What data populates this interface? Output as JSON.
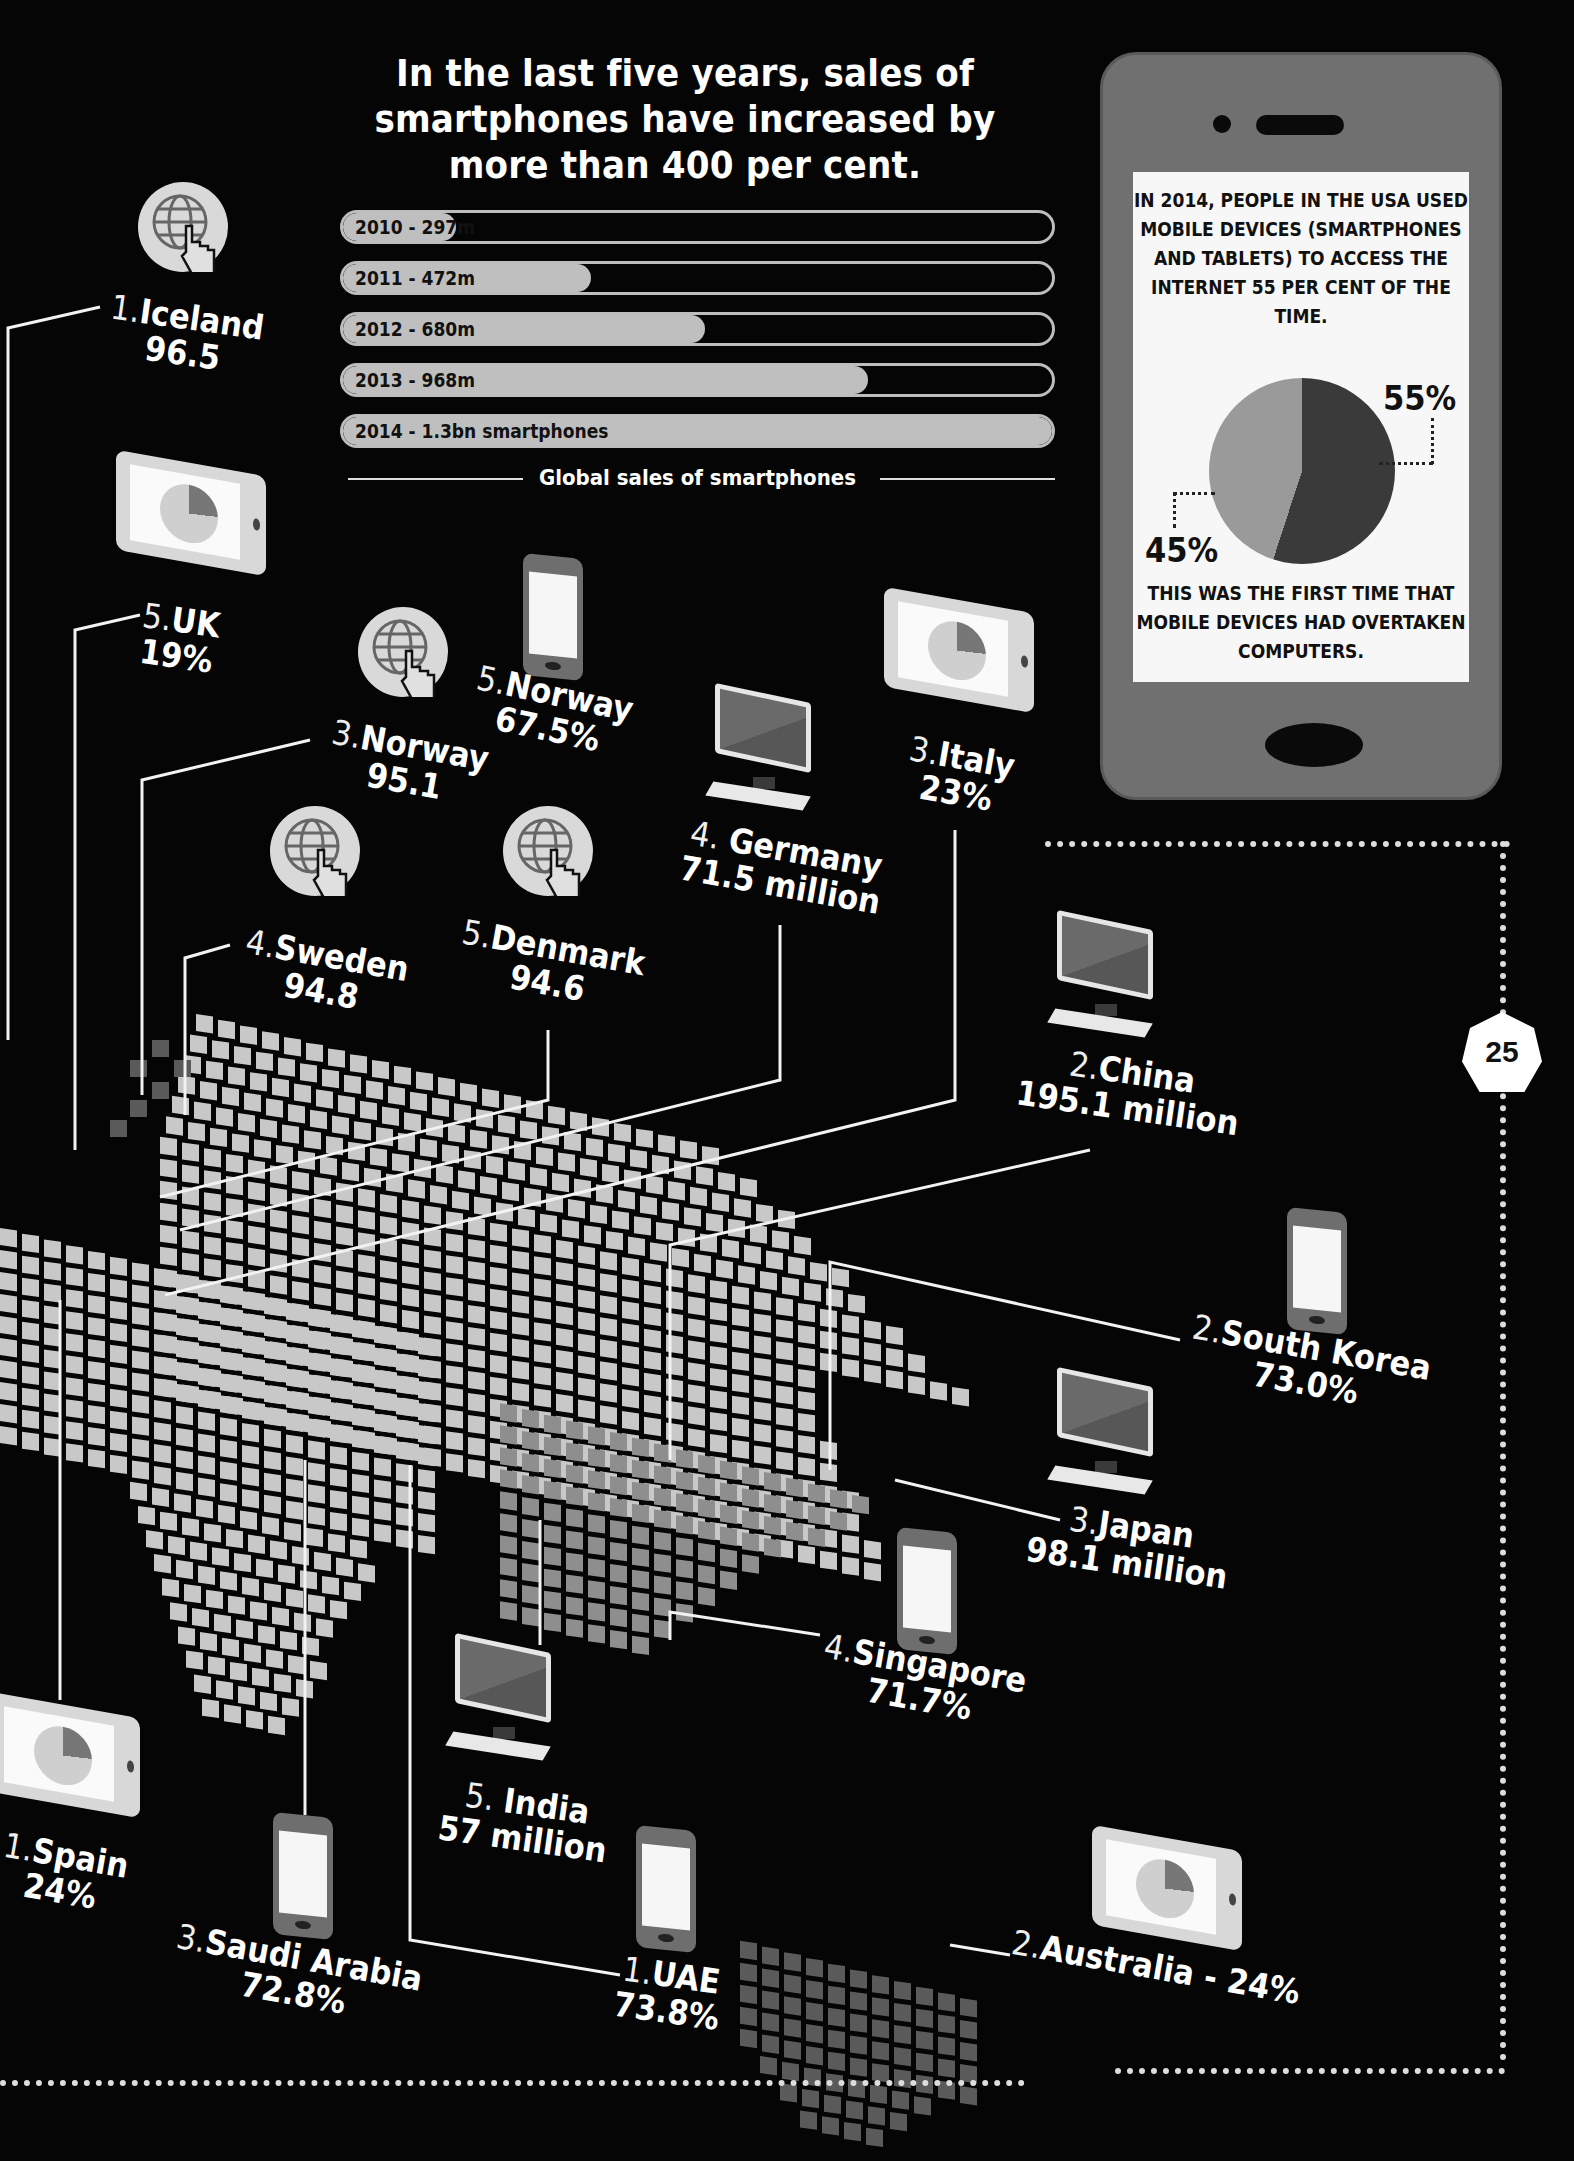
{
  "headline": "In the last five years, sales of smartphones have increased by more than 400 per cent.",
  "sales_chart": {
    "caption": "Global sales of smartphones",
    "bars": [
      {
        "label": "2010 - 297m",
        "fill_pct": 16
      },
      {
        "label": "2011 - 472m",
        "fill_pct": 35
      },
      {
        "label": "2012 - 680m",
        "fill_pct": 51
      },
      {
        "label": "2013 - 968m",
        "fill_pct": 74
      },
      {
        "label": "2014 - 1.3bn smartphones",
        "fill_pct": 100
      }
    ]
  },
  "usa_panel": {
    "text_top": "IN 2014, PEOPLE IN THE USA USED MOBILE DEVICES (SMARTPHONES AND TABLETS) TO ACCESS THE INTERNET 55 PER CENT OF THE TIME.",
    "label_mobile": "55%",
    "label_computer": "45%",
    "text_bottom": "THIS WAS THE FIRST TIME THAT MOBILE DEVICES HAD OVERTAKEN COMPUTERS."
  },
  "page_number": "25",
  "countries": {
    "iceland": {
      "rank": "1.",
      "name": "Iceland",
      "value": "96.5",
      "icon": "globe-click-icon"
    },
    "uk": {
      "rank": "5.",
      "name": "UK",
      "value": "19%",
      "icon": "tablet-icon"
    },
    "norway_internet": {
      "rank": "3.",
      "name": "Norway",
      "value": "95.1",
      "icon": "globe-click-icon"
    },
    "norway_smartphone": {
      "rank": "5.",
      "name": "Norway",
      "value": "67.5%",
      "icon": "smartphone-icon"
    },
    "germany": {
      "rank": "4. ",
      "name": "Germany",
      "value": "71.5 million",
      "icon": "computer-icon"
    },
    "italy": {
      "rank": "3.",
      "name": "Italy",
      "value": "23%",
      "icon": "tablet-icon"
    },
    "sweden": {
      "rank": "4.",
      "name": "Sweden",
      "value": "94.8",
      "icon": "globe-click-icon"
    },
    "denmark": {
      "rank": "5.",
      "name": "Denmark",
      "value": "94.6",
      "icon": "globe-click-icon"
    },
    "china": {
      "rank": "2.",
      "name": "China",
      "value": "195.1 million",
      "icon": "computer-icon"
    },
    "south_korea": {
      "rank": "2.",
      "name": "South Korea",
      "value": "73.0%",
      "icon": "smartphone-icon"
    },
    "japan": {
      "rank": "3.",
      "name": "Japan",
      "value": "98.1 million",
      "icon": "computer-icon"
    },
    "singapore": {
      "rank": "4.",
      "name": "Singapore",
      "value": "71.7%",
      "icon": "smartphone-icon"
    },
    "india": {
      "rank": "5. ",
      "name": "India",
      "value": "57 million",
      "icon": "computer-icon"
    },
    "uae": {
      "rank": "1.",
      "name": "UAE",
      "value": "73.8%",
      "icon": "smartphone-icon"
    },
    "saudi_arabia": {
      "rank": "3.",
      "name": "Saudi Arabia",
      "value": "72.8%",
      "icon": "smartphone-icon"
    },
    "spain": {
      "rank": "1.",
      "name": "Spain",
      "value": "24%",
      "icon": "tablet-icon"
    },
    "australia": {
      "rank": "2.",
      "name": "Australia - 24%",
      "value": "",
      "icon": "tablet-icon"
    }
  },
  "colors": {
    "background": "#050505",
    "map_tile_light": "#c8c8c8",
    "map_tile_mid": "#8e8e8e",
    "map_tile_dark": "#5a5a5a",
    "phone_body": "#707070",
    "pie_mobile": "#3a3a3a",
    "pie_computer": "#9a9a9a"
  },
  "chart_data": [
    {
      "type": "bar",
      "title": "Global sales of smartphones",
      "categories": [
        "2010",
        "2011",
        "2012",
        "2013",
        "2014"
      ],
      "values": [
        297,
        472,
        680,
        968,
        1300
      ],
      "unit": "million smartphones",
      "orientation": "horizontal",
      "xlabel": "",
      "ylabel": ""
    },
    {
      "type": "pie",
      "title": "USA internet access by device, 2014",
      "categories": [
        "Mobile devices (smartphones and tablets)",
        "Computers"
      ],
      "values": [
        55,
        45
      ],
      "unit": "%"
    },
    {
      "type": "table",
      "title": "Country rankings shown on map",
      "columns": [
        "country",
        "rank",
        "value",
        "metric_icon"
      ],
      "rows": [
        [
          "Iceland",
          1,
          "96.5",
          "internet"
        ],
        [
          "Norway",
          3,
          "95.1",
          "internet"
        ],
        [
          "Sweden",
          4,
          "94.8",
          "internet"
        ],
        [
          "Denmark",
          5,
          "94.6",
          "internet"
        ],
        [
          "UAE",
          1,
          "73.8%",
          "smartphone"
        ],
        [
          "South Korea",
          2,
          "73.0%",
          "smartphone"
        ],
        [
          "Saudi Arabia",
          3,
          "72.8%",
          "smartphone"
        ],
        [
          "Singapore",
          4,
          "71.7%",
          "smartphone"
        ],
        [
          "Norway",
          5,
          "67.5%",
          "smartphone"
        ],
        [
          "Spain",
          1,
          "24%",
          "tablet"
        ],
        [
          "Australia",
          2,
          "24%",
          "tablet"
        ],
        [
          "Italy",
          3,
          "23%",
          "tablet"
        ],
        [
          "UK",
          5,
          "19%",
          "tablet"
        ],
        [
          "China",
          2,
          "195.1 million",
          "computer"
        ],
        [
          "Japan",
          3,
          "98.1 million",
          "computer"
        ],
        [
          "Germany",
          4,
          "71.5 million",
          "computer"
        ],
        [
          "India",
          5,
          "57 million",
          "computer"
        ]
      ]
    }
  ]
}
